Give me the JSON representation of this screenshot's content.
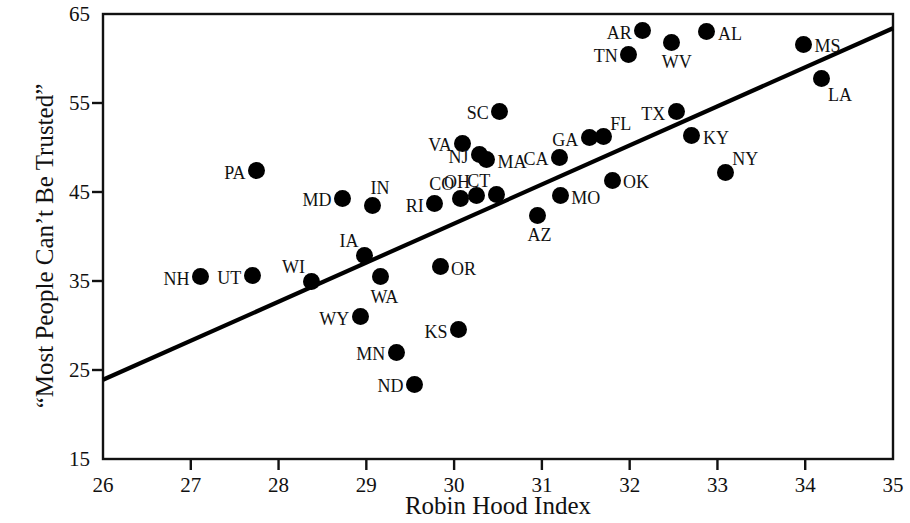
{
  "chart_data": {
    "type": "scatter",
    "title": "",
    "xlabel": "Robin Hood Index",
    "ylabel": "“Most People Can’t Be Trusted”",
    "xlim": [
      26,
      35
    ],
    "ylim": [
      15,
      65
    ],
    "xticks": [
      26,
      27,
      28,
      29,
      30,
      31,
      32,
      33,
      34,
      35
    ],
    "yticks": [
      15,
      25,
      35,
      45,
      55,
      65
    ],
    "grid": false,
    "legend": null,
    "marker_color": "#000000",
    "line_color": "#000000",
    "trend_line": {
      "type": "linear-fit",
      "x_start": 26,
      "y_start": 23.9,
      "x_end": 35,
      "y_end": 63.4
    },
    "points": [
      {
        "label": "NH",
        "x": 27.11,
        "y": 35.5,
        "label_pos": "left"
      },
      {
        "label": "UT",
        "x": 27.7,
        "y": 35.6,
        "label_pos": "left"
      },
      {
        "label": "PA",
        "x": 27.75,
        "y": 47.4,
        "label_pos": "left"
      },
      {
        "label": "WI",
        "x": 28.37,
        "y": 35.0,
        "label_pos": "nw"
      },
      {
        "label": "MD",
        "x": 28.73,
        "y": 44.3,
        "label_pos": "left"
      },
      {
        "label": "WY",
        "x": 28.93,
        "y": 31.0,
        "label_pos": "left"
      },
      {
        "label": "IA",
        "x": 28.98,
        "y": 37.9,
        "label_pos": "nw"
      },
      {
        "label": "IN",
        "x": 29.07,
        "y": 43.5,
        "label_pos": "above"
      },
      {
        "label": "WA",
        "x": 29.16,
        "y": 35.5,
        "label_pos": "below"
      },
      {
        "label": "MN",
        "x": 29.34,
        "y": 27.0,
        "label_pos": "left"
      },
      {
        "label": "ND",
        "x": 29.55,
        "y": 23.4,
        "label_pos": "left"
      },
      {
        "label": "RI",
        "x": 29.78,
        "y": 43.7,
        "label_pos": "left"
      },
      {
        "label": "OR",
        "x": 29.84,
        "y": 36.6,
        "label_pos": "right"
      },
      {
        "label": "CO",
        "x": 30.07,
        "y": 44.3,
        "label_pos": "nw"
      },
      {
        "label": "KS",
        "x": 30.05,
        "y": 29.5,
        "label_pos": "left"
      },
      {
        "label": "VA",
        "x": 30.1,
        "y": 50.5,
        "label_pos": "left"
      },
      {
        "label": "NJ",
        "x": 30.29,
        "y": 49.2,
        "label_pos": "left"
      },
      {
        "label": "OH",
        "x": 30.25,
        "y": 44.6,
        "label_pos": "nw"
      },
      {
        "label": "MA",
        "x": 30.37,
        "y": 48.6,
        "label_pos": "right"
      },
      {
        "label": "CT",
        "x": 30.48,
        "y": 44.7,
        "label_pos": "nw"
      },
      {
        "label": "SC",
        "x": 30.52,
        "y": 54.1,
        "label_pos": "left"
      },
      {
        "label": "AZ",
        "x": 30.95,
        "y": 42.4,
        "label_pos": "below"
      },
      {
        "label": "CA",
        "x": 31.2,
        "y": 48.9,
        "label_pos": "left"
      },
      {
        "label": "MO",
        "x": 31.21,
        "y": 44.6,
        "label_pos": "right"
      },
      {
        "label": "GA",
        "x": 31.54,
        "y": 51.1,
        "label_pos": "left"
      },
      {
        "label": "FL",
        "x": 31.7,
        "y": 51.2,
        "label_pos": "ne"
      },
      {
        "label": "OK",
        "x": 31.8,
        "y": 46.3,
        "label_pos": "right"
      },
      {
        "label": "TN",
        "x": 31.99,
        "y": 60.5,
        "label_pos": "left"
      },
      {
        "label": "AR",
        "x": 32.15,
        "y": 63.1,
        "label_pos": "left"
      },
      {
        "label": "WV",
        "x": 32.48,
        "y": 61.8,
        "label_pos": "below"
      },
      {
        "label": "TX",
        "x": 32.53,
        "y": 54.0,
        "label_pos": "left"
      },
      {
        "label": "KY",
        "x": 32.71,
        "y": 51.3,
        "label_pos": "right"
      },
      {
        "label": "AL",
        "x": 32.88,
        "y": 63.0,
        "label_pos": "right"
      },
      {
        "label": "NY",
        "x": 33.09,
        "y": 47.2,
        "label_pos": "ne"
      },
      {
        "label": "MS",
        "x": 33.98,
        "y": 61.6,
        "label_pos": "right"
      },
      {
        "label": "LA",
        "x": 34.18,
        "y": 57.8,
        "label_pos": "se"
      }
    ]
  },
  "axes": {
    "x_title": "Robin Hood Index",
    "y_title": "“Most People Can’t Be Trusted”",
    "x_tick_labels": [
      "26",
      "27",
      "28",
      "29",
      "30",
      "31",
      "32",
      "33",
      "34",
      "35"
    ],
    "y_tick_labels": [
      "15",
      "25",
      "35",
      "45",
      "55",
      "65"
    ]
  }
}
